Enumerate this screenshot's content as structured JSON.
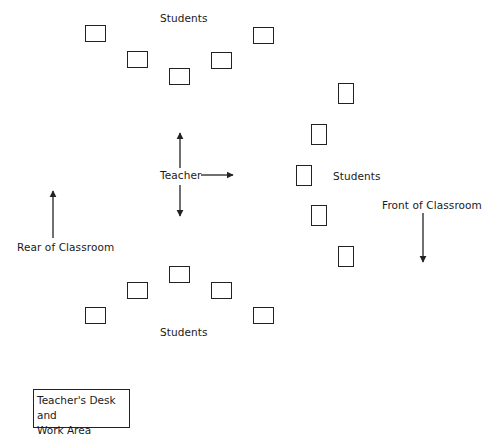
{
  "diagram": {
    "type": "classroom-seating-layout",
    "labels": {
      "students_top": "Students",
      "students_right": "Students",
      "students_bottom": "Students",
      "teacher": "Teacher",
      "front": "Front of Classroom",
      "rear": "Rear of Classroom",
      "teacher_desk_line1": "Teacher's Desk and",
      "teacher_desk_line2": "Work Area"
    },
    "desk_groups": {
      "top": [
        {
          "x": 85,
          "y": 25,
          "w": 21,
          "h": 17
        },
        {
          "x": 127,
          "y": 51,
          "w": 21,
          "h": 17
        },
        {
          "x": 169,
          "y": 68,
          "w": 21,
          "h": 17
        },
        {
          "x": 211,
          "y": 52,
          "w": 21,
          "h": 17
        },
        {
          "x": 253,
          "y": 27,
          "w": 21,
          "h": 17
        }
      ],
      "right": [
        {
          "x": 338,
          "y": 83,
          "w": 16,
          "h": 21
        },
        {
          "x": 311,
          "y": 124,
          "w": 16,
          "h": 21
        },
        {
          "x": 296,
          "y": 165,
          "w": 16,
          "h": 21
        },
        {
          "x": 311,
          "y": 205,
          "w": 16,
          "h": 21
        },
        {
          "x": 338,
          "y": 246,
          "w": 16,
          "h": 21
        }
      ],
      "bottom": [
        {
          "x": 85,
          "y": 307,
          "w": 21,
          "h": 17
        },
        {
          "x": 127,
          "y": 282,
          "w": 21,
          "h": 17
        },
        {
          "x": 169,
          "y": 266,
          "w": 21,
          "h": 17
        },
        {
          "x": 211,
          "y": 282,
          "w": 21,
          "h": 17
        },
        {
          "x": 253,
          "y": 307,
          "w": 21,
          "h": 17
        }
      ]
    },
    "arrows": [
      {
        "name": "teacher-up-arrow",
        "x1": 180,
        "y1": 168,
        "x2": 180,
        "y2": 133
      },
      {
        "name": "teacher-down-arrow",
        "x1": 180,
        "y1": 185,
        "x2": 180,
        "y2": 216
      },
      {
        "name": "teacher-right-arrow",
        "x1": 201,
        "y1": 175,
        "x2": 233,
        "y2": 175
      },
      {
        "name": "rear-arrow",
        "x1": 53,
        "y1": 238,
        "x2": 53,
        "y2": 191
      },
      {
        "name": "front-arrow",
        "x1": 423,
        "y1": 213,
        "x2": 423,
        "y2": 262
      }
    ],
    "stroke_color": "#222222"
  }
}
